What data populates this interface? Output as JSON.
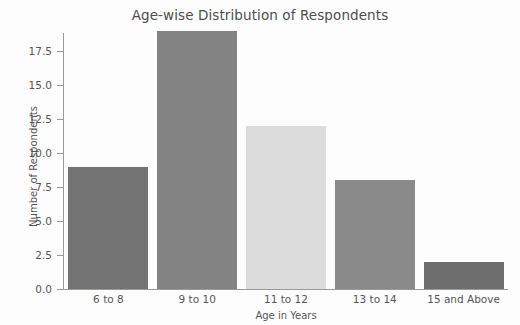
{
  "chart_data": {
    "type": "bar",
    "title": "Age-wise Distribution of Respondents",
    "xlabel": "Age in Years",
    "ylabel": "Number of Respondents",
    "categories": [
      "6 to 8",
      "9 to 10",
      "11 to 12",
      "13 to 14",
      "15 and Above"
    ],
    "values": [
      9,
      19,
      12,
      8,
      2
    ],
    "bar_colors": [
      "#737373",
      "#838383",
      "#dcdcdc",
      "#8a8a8a",
      "#6e6e6e"
    ],
    "ylim": [
      0.0,
      19.6
    ],
    "yticks": [
      "0.0",
      "2.5",
      "5.0",
      "7.5",
      "10.0",
      "12.5",
      "15.0",
      "17.5"
    ],
    "ytick_values": [
      0.0,
      2.5,
      5.0,
      7.5,
      10.0,
      12.5,
      15.0,
      17.5
    ],
    "grid": false,
    "legend": false,
    "background": "#fdfdfd",
    "axis_color": "#9a9a9a",
    "text_color": "#555555"
  }
}
